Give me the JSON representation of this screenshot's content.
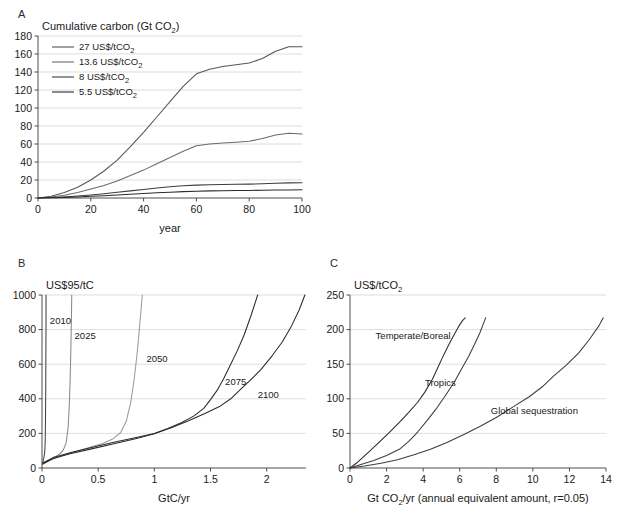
{
  "figure": {
    "background": "#ffffff",
    "line_color_dark": "#333333",
    "line_color_mid": "#5a5a5a",
    "line_color_light": "#8a8a8a",
    "grid_color": "#c8c8c8"
  },
  "panels": [
    {
      "letter": "A",
      "chart_data": {
        "type": "line",
        "title": "Cumulative carbon (Gt CO2)",
        "title_rich": [
          "Cumulative carbon (Gt CO",
          "2",
          ")"
        ],
        "xlabel": "year",
        "ylabel": "",
        "xlim": [
          0,
          100
        ],
        "ylim": [
          0,
          180
        ],
        "xticks": [
          0,
          20,
          40,
          60,
          80,
          100
        ],
        "yticks": [
          0,
          20,
          40,
          60,
          80,
          100,
          120,
          140,
          160,
          180
        ],
        "grid": "horizontal",
        "legend_position": "top-left",
        "series": [
          {
            "name": "27 US$/tCO2",
            "label_rich": [
              "27 US$/tCO",
              "2"
            ],
            "color": "#555555",
            "x": [
              0,
              5,
              10,
              15,
              20,
              25,
              30,
              35,
              40,
              45,
              50,
              55,
              60,
              65,
              70,
              75,
              80,
              85,
              90,
              95,
              100
            ],
            "y": [
              0,
              2,
              6,
              12,
              20,
              30,
              42,
              57,
              73,
              90,
              107,
              124,
              138,
              143,
              146,
              148,
              150,
              155,
              163,
              168,
              168
            ]
          },
          {
            "name": "13.6 US$/tCO2",
            "label_rich": [
              "13.6 US$/tCO",
              "2"
            ],
            "color": "#6a6a6a",
            "x": [
              0,
              5,
              10,
              15,
              20,
              25,
              30,
              35,
              40,
              45,
              50,
              55,
              60,
              65,
              70,
              75,
              80,
              85,
              90,
              95,
              100
            ],
            "y": [
              0,
              1,
              3,
              6,
              10,
              14,
              19,
              25,
              31,
              38,
              45,
              52,
              58,
              60,
              61,
              62,
              63,
              66,
              70,
              72,
              71
            ]
          },
          {
            "name": "8 US$/tCO2",
            "label_rich": [
              "8 US$/tCO",
              "2"
            ],
            "color": "#3d3d3d",
            "x": [
              0,
              5,
              10,
              15,
              20,
              25,
              30,
              35,
              40,
              45,
              50,
              55,
              60,
              65,
              70,
              75,
              80,
              85,
              90,
              95,
              100
            ],
            "y": [
              0,
              0.5,
              1.2,
              2.2,
              3.4,
              4.8,
              6.3,
              7.9,
              9.5,
              11,
              12.4,
              13.5,
              14.3,
              14.7,
              15,
              15.2,
              15.4,
              15.8,
              16.3,
              16.8,
              17
            ]
          },
          {
            "name": "5.5 US$/tCO2",
            "label_rich": [
              "5.5 US$/tCO",
              "2"
            ],
            "color": "#2b2b2b",
            "x": [
              0,
              5,
              10,
              15,
              20,
              25,
              30,
              35,
              40,
              45,
              50,
              55,
              60,
              65,
              70,
              75,
              80,
              85,
              90,
              95,
              100
            ],
            "y": [
              0,
              0.3,
              0.7,
              1.2,
              1.9,
              2.6,
              3.4,
              4.2,
              5.0,
              5.8,
              6.5,
              7.1,
              7.6,
              7.9,
              8.1,
              8.3,
              8.4,
              8.6,
              8.8,
              9.0,
              9.1
            ]
          }
        ]
      }
    },
    {
      "letter": "B",
      "chart_data": {
        "type": "line",
        "title": "US$95/tC",
        "xlabel": "GtC/yr",
        "ylabel": "",
        "xlim": [
          0,
          2.35
        ],
        "ylim": [
          0,
          1000
        ],
        "xticks": [
          0,
          0.5,
          1,
          1.5,
          2
        ],
        "yticks": [
          0,
          200,
          400,
          600,
          800,
          1000
        ],
        "grid": "horizontal",
        "annotations": [
          {
            "text": "2010",
            "x": 0.07,
            "y": 835
          },
          {
            "text": "2025",
            "x": 0.29,
            "y": 745
          },
          {
            "text": "2050",
            "x": 0.93,
            "y": 610
          },
          {
            "text": "2075",
            "x": 1.63,
            "y": 480
          },
          {
            "text": "2100",
            "x": 1.92,
            "y": 405
          }
        ],
        "series": [
          {
            "name": "2010",
            "color": "#444444",
            "x": [
              0.004,
              0.008,
              0.013,
              0.018,
              0.022,
              0.026,
              0.029,
              0.031,
              0.033,
              0.034,
              0.035,
              0.036,
              0.036
            ],
            "y": [
              20,
              35,
              50,
              65,
              80,
              110,
              170,
              280,
              430,
              580,
              720,
              870,
              1000
            ]
          },
          {
            "name": "2025",
            "color": "#8a8a8a",
            "x": [
              0.01,
              0.04,
              0.08,
              0.12,
              0.16,
              0.19,
              0.215,
              0.232,
              0.242,
              0.25,
              0.256,
              0.261,
              0.265
            ],
            "y": [
              22,
              38,
              52,
              66,
              82,
              105,
              145,
              230,
              350,
              500,
              660,
              830,
              1000
            ]
          },
          {
            "name": "2050",
            "color": "#9a9a9a",
            "x": [
              0.01,
              0.08,
              0.18,
              0.3,
              0.42,
              0.54,
              0.63,
              0.7,
              0.75,
              0.79,
              0.82,
              0.845,
              0.865,
              0.88,
              0.893
            ],
            "y": [
              25,
              48,
              72,
              95,
              118,
              142,
              168,
              205,
              270,
              380,
              510,
              650,
              790,
              900,
              1000
            ]
          },
          {
            "name": "2075",
            "color": "#2b2b2b",
            "x": [
              0.01,
              0.1,
              0.25,
              0.45,
              0.65,
              0.85,
              1.0,
              1.12,
              1.24,
              1.35,
              1.44,
              1.5,
              1.56,
              1.62,
              1.68,
              1.74,
              1.8,
              1.86,
              1.92
            ],
            "y": [
              30,
              60,
              88,
              120,
              150,
              178,
              200,
              228,
              262,
              300,
              345,
              395,
              450,
              520,
              600,
              680,
              770,
              880,
              1000
            ]
          },
          {
            "name": "2100",
            "color": "#2b2b2b",
            "x": [
              0.01,
              0.1,
              0.25,
              0.45,
              0.65,
              0.85,
              1.0,
              1.15,
              1.3,
              1.45,
              1.58,
              1.68,
              1.76,
              1.85,
              1.95,
              2.05,
              2.14,
              2.22,
              2.29,
              2.34
            ],
            "y": [
              25,
              55,
              82,
              112,
              142,
              172,
              198,
              232,
              272,
              315,
              355,
              400,
              450,
              505,
              570,
              650,
              730,
              820,
              915,
              1000
            ]
          }
        ]
      }
    },
    {
      "letter": "C",
      "chart_data": {
        "type": "line",
        "title": "US$/tCO2",
        "title_rich": [
          "US$/tCO",
          "2"
        ],
        "xlabel": "Gt CO2/yr (annual equivalent amount, r=0.05)",
        "xlabel_rich": [
          "Gt CO",
          "2",
          "/yr (annual equivalent amount, r=0.05)"
        ],
        "ylabel": "",
        "xlim": [
          0,
          14
        ],
        "ylim": [
          0,
          250
        ],
        "xticks": [
          0,
          2,
          4,
          6,
          8,
          10,
          12,
          14
        ],
        "yticks": [
          0,
          50,
          100,
          150,
          200,
          250
        ],
        "grid": "horizontal",
        "annotations": [
          {
            "text": "Temperate/Boreal",
            "x": 1.4,
            "y": 186
          },
          {
            "text": "Tropics",
            "x": 4.1,
            "y": 118
          },
          {
            "text": "Global sequestration",
            "x": 7.7,
            "y": 78
          }
        ],
        "series": [
          {
            "name": "Temperate/Boreal",
            "color": "#2b2b2b",
            "x": [
              0,
              0.4,
              0.9,
              1.5,
              2.1,
              2.7,
              3.2,
              3.7,
              4.1,
              4.5,
              4.8,
              5.1,
              5.4,
              5.7,
              5.95,
              6.15,
              6.3
            ],
            "y": [
              0,
              8,
              20,
              35,
              50,
              66,
              80,
              95,
              110,
              128,
              145,
              162,
              178,
              193,
              205,
              213,
              217
            ]
          },
          {
            "name": "Tropics",
            "color": "#3d3d3d",
            "x": [
              0,
              0.6,
              1.3,
              2.0,
              2.7,
              3.2,
              3.7,
              4.2,
              4.7,
              5.2,
              5.7,
              6.1,
              6.5,
              6.8,
              7.1,
              7.3,
              7.42
            ],
            "y": [
              0,
              5,
              11,
              18,
              27,
              38,
              52,
              68,
              85,
              104,
              124,
              143,
              162,
              178,
              195,
              209,
              217
            ]
          },
          {
            "name": "Global sequestration",
            "color": "#3d3d3d",
            "x": [
              0,
              0.8,
              1.7,
              2.6,
              3.5,
              4.4,
              5.3,
              6.2,
              7.1,
              8.0,
              8.9,
              9.8,
              10.5,
              11.1,
              11.8,
              12.5,
              13.1,
              13.6,
              13.85
            ],
            "y": [
              0,
              3,
              7,
              12,
              19,
              27,
              37,
              48,
              60,
              73,
              88,
              103,
              117,
              132,
              148,
              166,
              186,
              205,
              217
            ]
          }
        ]
      }
    }
  ]
}
